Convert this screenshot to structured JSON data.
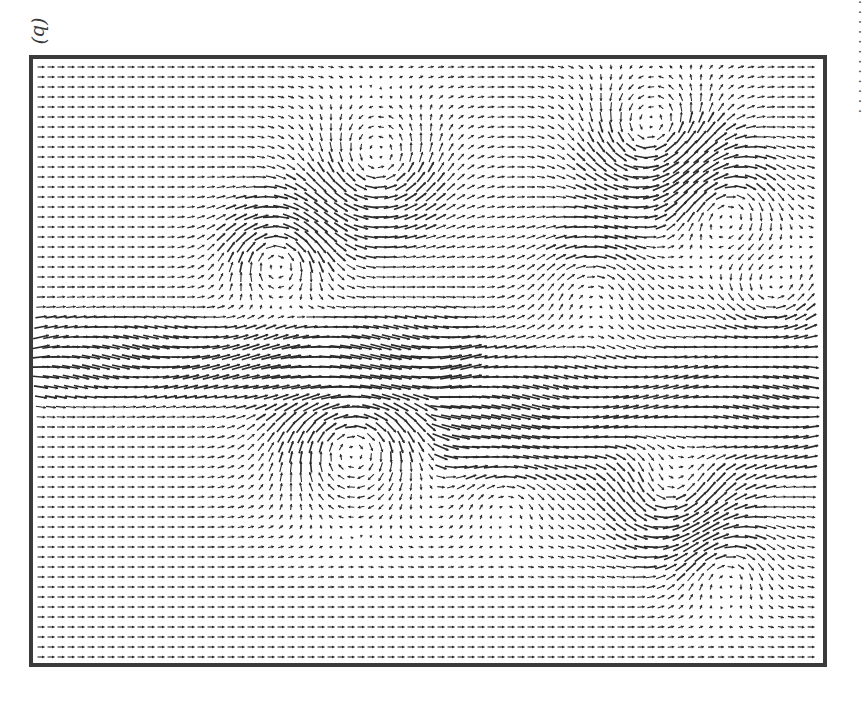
{
  "figure": {
    "panel_label": "(b)",
    "frame_color": "#3b3b3b",
    "vector_color": "#2a2a2a",
    "caption_fragment": "· · · · · · · · · · · ·"
  },
  "chart_data": {
    "type": "quiver",
    "title": "",
    "panel": "(b)",
    "xlabel": "",
    "ylabel": "",
    "grid": false,
    "legend": null,
    "grid_spacing_px": 10,
    "field_extent_px": {
      "width": 790,
      "height": 604
    },
    "freestream": {
      "u": 1.0,
      "v": 0.0,
      "arrow_len_px": 7
    },
    "jet": [
      {
        "x_start": 0,
        "x_end": 420,
        "y_center": 300,
        "width": 40,
        "strength": 2.6
      },
      {
        "x_start": 420,
        "x_end": 790,
        "y_center": 350,
        "width": 70,
        "strength": 2.2
      }
    ],
    "vortices": [
      {
        "x": 620,
        "y": 80,
        "strength": -1.8,
        "radius": 45
      },
      {
        "x": 690,
        "y": 140,
        "strength": 1.4,
        "radius": 40
      },
      {
        "x": 345,
        "y": 110,
        "strength": -1.6,
        "radius": 45
      },
      {
        "x": 245,
        "y": 195,
        "strength": 1.8,
        "radius": 35
      },
      {
        "x": 320,
        "y": 380,
        "strength": 2.0,
        "radius": 50
      },
      {
        "x": 640,
        "y": 440,
        "strength": -1.6,
        "radius": 40
      },
      {
        "x": 690,
        "y": 500,
        "strength": 1.2,
        "radius": 35
      },
      {
        "x": 560,
        "y": 220,
        "strength": 1.0,
        "radius": 40
      },
      {
        "x": 740,
        "y": 240,
        "strength": -1.0,
        "radius": 35
      },
      {
        "x": 470,
        "y": 420,
        "strength": 1.0,
        "radius": 40
      }
    ]
  }
}
